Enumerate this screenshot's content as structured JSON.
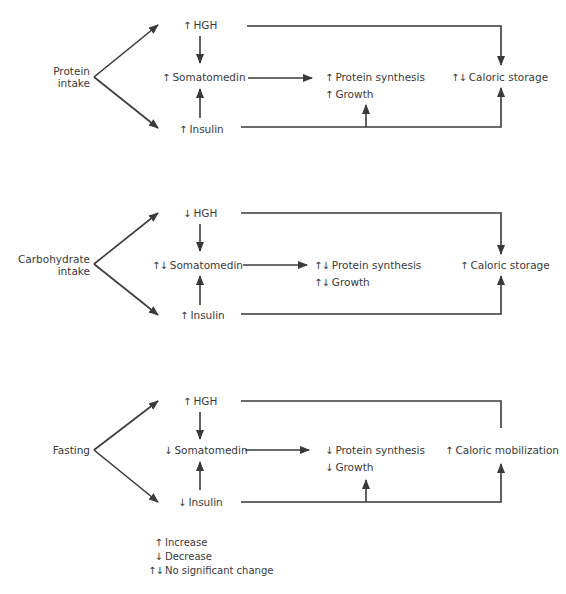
{
  "indicators": {
    "up": "↑",
    "down": "↓",
    "nochange": "↑↓"
  },
  "colors": {
    "ink": "#3a3a3a",
    "background": "#ffffff"
  },
  "panels": [
    {
      "input": {
        "line1": "Protein",
        "line2": "intake"
      },
      "hgh": {
        "ind": "↑",
        "label": "HGH"
      },
      "somatomedin": {
        "ind": "↑",
        "label": "Somatomedin"
      },
      "insulin": {
        "ind": "↑",
        "label": "Insulin"
      },
      "protein_synthesis": {
        "ind": "↑",
        "label": "Protein synthesis"
      },
      "growth": {
        "ind": "↑",
        "label": "Growth"
      },
      "caloric": {
        "ind": "↑↓",
        "label": "Caloric storage"
      },
      "insulin_to_growth_arrow": true,
      "hgh_to_caloric_arrowhead": true
    },
    {
      "input": {
        "line1": "Carbohydrate",
        "line2": "intake"
      },
      "hgh": {
        "ind": "↓",
        "label": "HGH"
      },
      "somatomedin": {
        "ind": "↑↓",
        "label": "Somatomedin"
      },
      "insulin": {
        "ind": "↑",
        "label": "Insulin"
      },
      "protein_synthesis": {
        "ind": "↑↓",
        "label": "Protein synthesis"
      },
      "growth": {
        "ind": "↑↓",
        "label": "Growth"
      },
      "caloric": {
        "ind": "↑",
        "label": "Caloric storage"
      },
      "insulin_to_growth_arrow": false,
      "hgh_to_caloric_arrowhead": true
    },
    {
      "input": {
        "line1": "Fasting",
        "line2": ""
      },
      "hgh": {
        "ind": "↑",
        "label": "HGH"
      },
      "somatomedin": {
        "ind": "↓",
        "label": "Somatomedin"
      },
      "insulin": {
        "ind": "↓",
        "label": "Insulin"
      },
      "protein_synthesis": {
        "ind": "↓",
        "label": "Protein synthesis"
      },
      "growth": {
        "ind": "↓",
        "label": "Growth"
      },
      "caloric": {
        "ind": "↑",
        "label": "Caloric mobilization"
      },
      "insulin_to_growth_arrow": true,
      "hgh_to_caloric_arrowhead": false
    }
  ],
  "legend": [
    {
      "ind": "↑",
      "label": "Increase"
    },
    {
      "ind": "↓",
      "label": "Decrease"
    },
    {
      "ind": "↑↓",
      "label": "No significant change"
    }
  ]
}
